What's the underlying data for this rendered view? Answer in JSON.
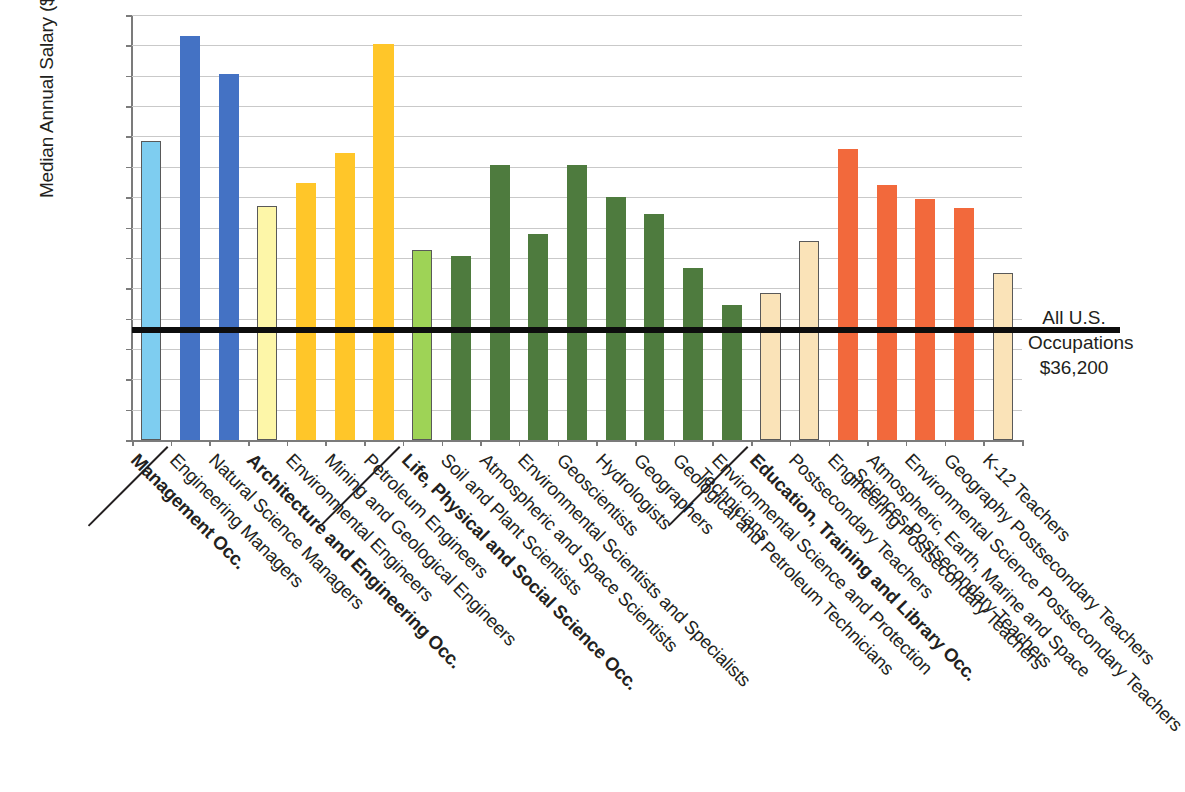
{
  "chart_data": {
    "type": "bar",
    "title": "",
    "xlabel": "",
    "ylabel": "Median Annual Salary ($USD)",
    "ylim": [
      0,
      140000
    ],
    "ytick_step": 10000,
    "grid": true,
    "legend": "none",
    "ytick_labels": [
      "$140,000",
      "$130,000",
      "$120,000",
      "$110,000",
      "$100,000",
      "$90,000",
      "$80,000",
      "$70,000",
      "$60,000",
      "$50,000",
      "$40,000",
      "$30,000",
      "$20,000",
      "$10,000",
      "$0"
    ],
    "reference_line": {
      "label_line1": "All U.S.",
      "label_line2": "Occupations",
      "label_line3": "$36,200",
      "value": 36200,
      "color": "#0d0d0d"
    },
    "categories": [
      "Management Occ.",
      "Engineering Managers",
      "Natural Science Managers",
      "Architecture and Engineering Occ.",
      "Environmental Engineers",
      "Mining and Geological Engineers",
      "Petroleum Engineers",
      "Life, Physical and Social Science Occ.",
      "Soil and Plant Scientists",
      "Atmospheric and Space Scientists",
      "Environmental Scientists and Specialists",
      "Geoscientists",
      "Hydrologists",
      "Geographers",
      "Geological and Petroleum Technicians",
      "Environmental Science and Protection Technicians",
      "Education, Training and Library Occ.",
      "Postsecondary Teachers",
      "Engineering Postsecondary Teachers",
      "Atmospheric, Earth, Marine and Space Sciences Postsecondary Teachers",
      "Environmental Science Postsecondary Teachers",
      "Geography Postsecondary Teachers",
      "K-12 Teachers"
    ],
    "values": [
      98500,
      133000,
      120500,
      77000,
      84500,
      94500,
      130500,
      62500,
      60500,
      90500,
      68000,
      90500,
      80000,
      74500,
      56500,
      44500,
      48500,
      65500,
      96000,
      84000,
      79500,
      76500,
      55000
    ],
    "bar_colors": [
      "#7ecdf0",
      "#4472c4",
      "#4472c4",
      "#fdf6a8",
      "#ffc629",
      "#ffc629",
      "#ffc629",
      "#9ed356",
      "#4e7b3e",
      "#4e7b3e",
      "#4e7b3e",
      "#4e7b3e",
      "#4e7b3e",
      "#4e7b3e",
      "#4e7b3e",
      "#4e7b3e",
      "#fae3b8",
      "#fae3b8",
      "#f2693c",
      "#f2693c",
      "#f2693c",
      "#f2693c",
      "#fae3b8"
    ],
    "bar_outlined": [
      true,
      false,
      false,
      true,
      false,
      false,
      false,
      true,
      false,
      false,
      false,
      false,
      false,
      false,
      false,
      false,
      true,
      true,
      false,
      false,
      false,
      false,
      true
    ],
    "bold_labels": [
      true,
      false,
      false,
      true,
      false,
      false,
      false,
      true,
      false,
      false,
      false,
      false,
      false,
      false,
      false,
      false,
      true,
      false,
      false,
      false,
      false,
      false,
      false
    ],
    "group_separator_after": [
      0,
      6,
      15
    ]
  }
}
